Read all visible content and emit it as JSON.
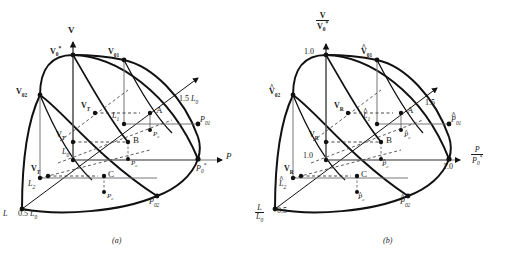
{
  "figure": {
    "type": "technical-diagram",
    "captions": {
      "a": "(a)",
      "b": "(b)"
    }
  },
  "panel_a": {
    "axes": {
      "vertical": {
        "label": "V",
        "bold": true
      },
      "horizontal": {
        "label": "P",
        "italic": true
      },
      "depth": {
        "label": "L",
        "italic": true
      }
    },
    "axis_ticks": {
      "depth_upper": "1.5 L0",
      "depth_lower": "0.5 L0"
    },
    "vertex_labels": {
      "v0star": "V0*",
      "v01": "V01",
      "v02": "V02",
      "p01": "P01",
      "p02": "P02",
      "p0star": "P0*"
    },
    "level_labels": {
      "l0": "L0",
      "l1": "L1",
      "l2": "L2"
    },
    "point_labels": {
      "a": "A",
      "b": "B",
      "c": "C"
    },
    "vt_labels": [
      "VT",
      "VT",
      "VT"
    ],
    "pc_labels": [
      "Pc",
      "Pc",
      "Pc"
    ]
  },
  "panel_b": {
    "axes": {
      "vertical": {
        "numerator": "V",
        "denominator": "V0*"
      },
      "horizontal": {
        "numerator": "P",
        "denominator": "P0*"
      },
      "depth": {
        "numerator": "L",
        "denominator": "L0"
      }
    },
    "axis_ticks": {
      "vertical_top": "1.0",
      "vertical_mid": "1.0",
      "horizontal_right": "1.0",
      "depth_upper": "1.5",
      "depth_lower": "0.5"
    },
    "vertex_labels": {
      "v0star": "1.0",
      "v01": "V01",
      "v02": "V02",
      "p01": "P01",
      "p02": "P02",
      "p0star": "1.0"
    },
    "level_labels": {
      "l1": "L1",
      "l2": "L2"
    },
    "point_labels": {
      "a": "A",
      "b": "B",
      "c": "C"
    },
    "vr_labels": [
      "VR",
      "VR",
      "VR"
    ],
    "pc_labels": [
      "Pc",
      "Pc",
      "Pc"
    ]
  },
  "style": {
    "line_color": "#111111",
    "grid_color": "#555555",
    "bg_color": "#ffffff"
  }
}
